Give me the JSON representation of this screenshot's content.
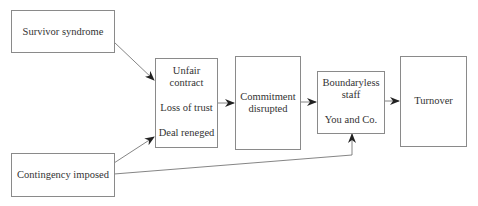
{
  "diagram": {
    "type": "flowchart",
    "nodes": {
      "survivor": {
        "label": "Survivor syndrome"
      },
      "contingency": {
        "label": "Contingency imposed"
      },
      "unfair": {
        "lines": [
          "Unfair",
          "contract",
          "Loss of trust",
          "Deal reneged"
        ]
      },
      "commitment": {
        "lines": [
          "Commitment",
          "disrupted"
        ]
      },
      "boundaryless": {
        "lines": [
          "Boundaryless",
          "staff",
          "You and Co."
        ]
      },
      "turnover": {
        "label": "Turnover"
      }
    },
    "edges": [
      {
        "from": "Survivor syndrome",
        "to": "Unfair contract"
      },
      {
        "from": "Contingency imposed",
        "to": "Unfair contract"
      },
      {
        "from": "Contingency imposed",
        "to": "Boundaryless staff"
      },
      {
        "from": "Unfair contract",
        "to": "Commitment disrupted"
      },
      {
        "from": "Commitment disrupted",
        "to": "Boundaryless staff"
      },
      {
        "from": "Boundaryless staff",
        "to": "Turnover"
      }
    ],
    "colors": {
      "border": "#8a8a8a",
      "arrow": "#222222",
      "text": "#333333"
    }
  }
}
